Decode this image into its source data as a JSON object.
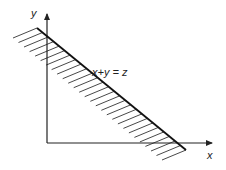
{
  "diagram": {
    "axis_labels": {
      "x": "x",
      "y": "y"
    },
    "line_label": "x+y = z",
    "shaded_region": "below-left of line x+y = z (hatched)",
    "colors": {
      "ink": "#222222",
      "background": "#ffffff"
    }
  }
}
